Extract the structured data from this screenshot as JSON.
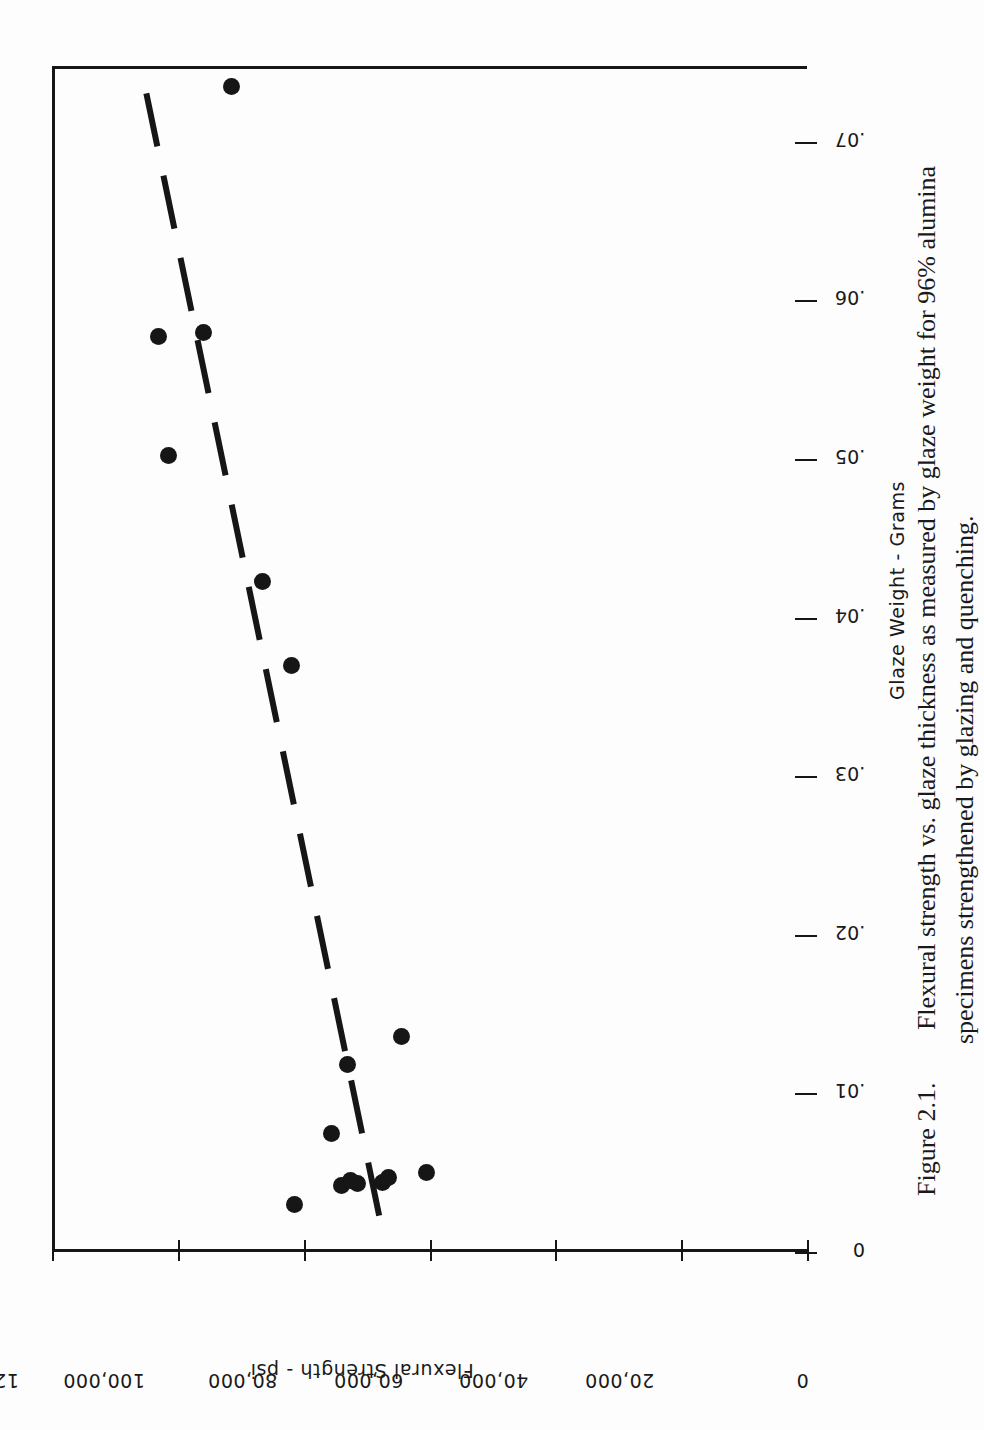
{
  "figure": {
    "number": "Figure 2.1.",
    "caption_line_1": "Flexural strength vs. glaze thickness as measured by glaze weight for 96% alumina",
    "caption_line_2": "specimens strengthened by glazing and quenching."
  },
  "chart_data": {
    "type": "scatter",
    "title": "Flexural strength vs. glaze thickness as measured by glaze weight for 96% alumina specimens strengthened by glazing and quenching.",
    "xlabel": "Glaze Weight - Grams",
    "ylabel": "Flexural Strength - psi",
    "xlim": [
      0,
      0.0748
    ],
    "ylim": [
      0,
      120000
    ],
    "grid": false,
    "legend": null,
    "orientation": "rotated-90-clockwise",
    "xticks": [
      0,
      0.01,
      0.02,
      0.03,
      0.04,
      0.05,
      0.06,
      0.07
    ],
    "xticklabels": [
      "0",
      ".01",
      ".02",
      ".03",
      ".04",
      ".05",
      ".06",
      ".07"
    ],
    "yticks": [
      0,
      20000,
      40000,
      60000,
      80000,
      100000,
      120000
    ],
    "yticklabels": [
      "0",
      "20,000",
      "40,000",
      "60,000",
      "80,000",
      "100,000",
      "120,000"
    ],
    "points": [
      {
        "x": 0.003,
        "y": 81500
      },
      {
        "x": 0.0042,
        "y": 74000
      },
      {
        "x": 0.0043,
        "y": 71500
      },
      {
        "x": 0.0044,
        "y": 67500
      },
      {
        "x": 0.0045,
        "y": 72500
      },
      {
        "x": 0.0047,
        "y": 66500
      },
      {
        "x": 0.005,
        "y": 60500
      },
      {
        "x": 0.0075,
        "y": 75500
      },
      {
        "x": 0.0118,
        "y": 73000
      },
      {
        "x": 0.0136,
        "y": 64500
      },
      {
        "x": 0.037,
        "y": 82000
      },
      {
        "x": 0.0423,
        "y": 86500
      },
      {
        "x": 0.0502,
        "y": 101500
      },
      {
        "x": 0.0577,
        "y": 103000
      },
      {
        "x": 0.058,
        "y": 96000
      },
      {
        "x": 0.0735,
        "y": 91500
      }
    ],
    "trendline": {
      "style": "dashed",
      "x_start": 0.0023,
      "y_start": 68000,
      "x_end": 0.074,
      "y_end": 105500
    }
  }
}
